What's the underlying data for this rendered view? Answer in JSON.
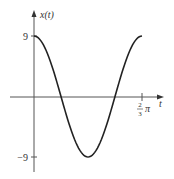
{
  "chart_data": {
    "type": "line",
    "title": "",
    "function": "x(t) = 9 cos(3t)",
    "xlabel": "t",
    "ylabel": "x(t)",
    "xlim": [
      0,
      2.0944
    ],
    "ylim": [
      -9,
      9
    ],
    "x_ticks": [
      {
        "value": 2.0944,
        "label_num": "2",
        "label_den": "3",
        "label_suffix": "π"
      }
    ],
    "y_ticks": [
      {
        "value": 9,
        "label": "9"
      },
      {
        "value": -9,
        "label": "−9"
      }
    ],
    "series": [
      {
        "name": "x(t)",
        "amplitude": 9,
        "period": 2.0944,
        "x": [
          0,
          0.2618,
          0.5236,
          0.7854,
          1.0472,
          1.309,
          1.5708,
          1.8326,
          2.0944
        ],
        "y": [
          9,
          6.36,
          0,
          -6.36,
          -9,
          -6.36,
          0,
          6.36,
          9
        ]
      }
    ],
    "grid": false,
    "legend": "none"
  }
}
